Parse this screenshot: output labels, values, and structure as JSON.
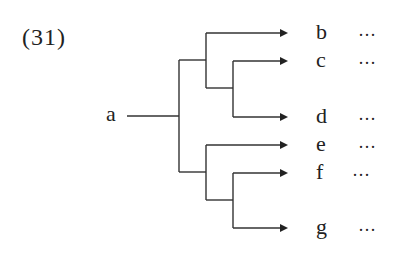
{
  "problem_number": "(31)",
  "root": {
    "label": "a"
  },
  "leaves": [
    {
      "label": "b",
      "suffix": "···"
    },
    {
      "label": "c",
      "suffix": "···"
    },
    {
      "label": "d",
      "suffix": "···"
    },
    {
      "label": "e",
      "suffix": "···"
    },
    {
      "label": "f",
      "suffix": "···"
    },
    {
      "label": "g",
      "suffix": "···"
    }
  ],
  "structure": {
    "description": "Binary tree diagram: root a splits into two groups; upper group branches to b and a sub-branch (c, d); lower group branches to e and a sub-branch (f, g).",
    "groups": [
      {
        "children": [
          "b",
          [
            "c",
            "d"
          ]
        ]
      },
      {
        "children": [
          "e",
          [
            "f",
            "g"
          ]
        ]
      }
    ]
  },
  "colors": {
    "line": "#333333",
    "text": "#222222",
    "background": "#ffffff"
  }
}
